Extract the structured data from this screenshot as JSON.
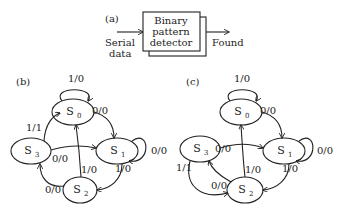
{
  "panel_a": {
    "label": "(a)",
    "input_label_1": "Serial",
    "input_label_2": "data",
    "box_line_1": "Binary",
    "box_line_2": "pattern",
    "box_line_3": "detector",
    "output_label": "Found"
  },
  "panel_b": {
    "label": "(b)",
    "states": [
      {
        "name": "S",
        "sub": "0"
      },
      {
        "name": "S",
        "sub": "1"
      },
      {
        "name": "S",
        "sub": "2"
      },
      {
        "name": "S",
        "sub": "3"
      }
    ],
    "transitions": [
      {
        "from": "S0",
        "to": "S0",
        "label": "1/0"
      },
      {
        "from": "S0",
        "to": "S1",
        "label": "0/0"
      },
      {
        "from": "S1",
        "to": "S1",
        "label": "0/0"
      },
      {
        "from": "S1",
        "to": "S2",
        "label": "1/0"
      },
      {
        "from": "S2",
        "to": "S0",
        "label": "1/0"
      },
      {
        "from": "S2",
        "to": "S3",
        "label": "0/0"
      },
      {
        "from": "S3",
        "to": "S1",
        "label": "0/0"
      },
      {
        "from": "S3",
        "to": "S0",
        "label": "1/1"
      }
    ]
  },
  "panel_c": {
    "label": "(c)",
    "states": [
      {
        "name": "S",
        "sub": "0"
      },
      {
        "name": "S",
        "sub": "1"
      },
      {
        "name": "S",
        "sub": "2"
      },
      {
        "name": "S",
        "sub": "3"
      }
    ],
    "transitions": [
      {
        "from": "S0",
        "to": "S0",
        "label": "1/0"
      },
      {
        "from": "S0",
        "to": "S1",
        "label": "0/0"
      },
      {
        "from": "S1",
        "to": "S1",
        "label": "0/0"
      },
      {
        "from": "S1",
        "to": "S2",
        "label": "1/0"
      },
      {
        "from": "S2",
        "to": "S0",
        "label": "1/0"
      },
      {
        "from": "S2",
        "to": "S3",
        "label": "0/0"
      },
      {
        "from": "S3",
        "to": "S1",
        "label": "0/0"
      },
      {
        "from": "S3",
        "to": "S2",
        "label": "1/1"
      }
    ]
  }
}
